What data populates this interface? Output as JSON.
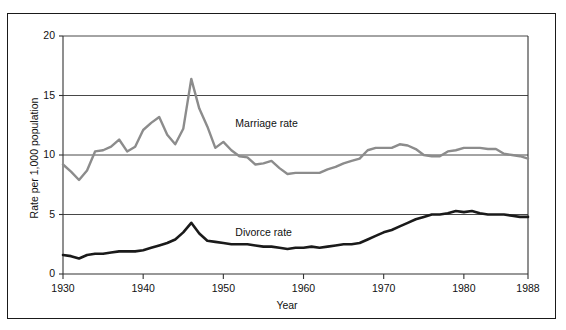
{
  "figure": {
    "background": "#ffffff",
    "frame_color": "#1a1a1a"
  },
  "chart_data": {
    "type": "line",
    "title": "",
    "xlabel": "Year",
    "ylabel": "Rate per 1,000 population",
    "xlim": [
      1930,
      1988
    ],
    "ylim": [
      0,
      20
    ],
    "grid": "horizontal",
    "legend_position": "inline-annotation",
    "x_ticks": [
      1930,
      1940,
      1950,
      1960,
      1970,
      1980,
      1988
    ],
    "x_tick_labels": [
      "1930",
      "1940",
      "1950",
      "1960",
      "1970",
      "1980",
      "1988"
    ],
    "y_ticks": [
      0,
      5,
      10,
      15,
      20
    ],
    "y_tick_labels": [
      "0",
      "5",
      "10",
      "15",
      "20"
    ],
    "annotations": [
      {
        "text": "Marriage rate",
        "x": 1951.5,
        "y": 12.6
      },
      {
        "text": "Divorce rate",
        "x": 1951.5,
        "y": 3.45
      }
    ],
    "series": [
      {
        "name": "Marriage rate",
        "color": "#8c8c8c",
        "width": 2.4,
        "x": [
          1930,
          1931,
          1932,
          1933,
          1934,
          1935,
          1936,
          1937,
          1938,
          1939,
          1940,
          1941,
          1942,
          1943,
          1944,
          1945,
          1946,
          1947,
          1948,
          1949,
          1950,
          1951,
          1952,
          1953,
          1954,
          1955,
          1956,
          1957,
          1958,
          1959,
          1960,
          1961,
          1962,
          1963,
          1964,
          1965,
          1966,
          1967,
          1968,
          1969,
          1970,
          1971,
          1972,
          1973,
          1974,
          1975,
          1976,
          1977,
          1978,
          1979,
          1980,
          1981,
          1982,
          1983,
          1984,
          1985,
          1986,
          1987,
          1988
        ],
        "values": [
          9.2,
          8.6,
          7.9,
          8.7,
          10.3,
          10.4,
          10.7,
          11.3,
          10.3,
          10.7,
          12.1,
          12.7,
          13.2,
          11.7,
          10.9,
          12.2,
          16.4,
          13.9,
          12.4,
          10.6,
          11.1,
          10.4,
          9.9,
          9.8,
          9.2,
          9.3,
          9.5,
          8.9,
          8.4,
          8.5,
          8.5,
          8.5,
          8.5,
          8.8,
          9.0,
          9.3,
          9.5,
          9.7,
          10.4,
          10.6,
          10.6,
          10.6,
          10.9,
          10.8,
          10.5,
          10.0,
          9.9,
          9.9,
          10.3,
          10.4,
          10.6,
          10.6,
          10.6,
          10.5,
          10.5,
          10.1,
          10.0,
          9.9,
          9.7
        ]
      },
      {
        "name": "Divorce rate",
        "color": "#1a1a1a",
        "width": 2.6,
        "x": [
          1930,
          1931,
          1932,
          1933,
          1934,
          1935,
          1936,
          1937,
          1938,
          1939,
          1940,
          1941,
          1942,
          1943,
          1944,
          1945,
          1946,
          1947,
          1948,
          1949,
          1950,
          1951,
          1952,
          1953,
          1954,
          1955,
          1956,
          1957,
          1958,
          1959,
          1960,
          1961,
          1962,
          1963,
          1964,
          1965,
          1966,
          1967,
          1968,
          1969,
          1970,
          1971,
          1972,
          1973,
          1974,
          1975,
          1976,
          1977,
          1978,
          1979,
          1980,
          1981,
          1982,
          1983,
          1984,
          1985,
          1986,
          1987,
          1988
        ],
        "values": [
          1.6,
          1.5,
          1.3,
          1.6,
          1.7,
          1.7,
          1.8,
          1.9,
          1.9,
          1.9,
          2.0,
          2.2,
          2.4,
          2.6,
          2.9,
          3.5,
          4.3,
          3.4,
          2.8,
          2.7,
          2.6,
          2.5,
          2.5,
          2.5,
          2.4,
          2.3,
          2.3,
          2.2,
          2.1,
          2.2,
          2.2,
          2.3,
          2.2,
          2.3,
          2.4,
          2.5,
          2.5,
          2.6,
          2.9,
          3.2,
          3.5,
          3.7,
          4.0,
          4.3,
          4.6,
          4.8,
          5.0,
          5.0,
          5.1,
          5.3,
          5.2,
          5.3,
          5.1,
          5.0,
          5.0,
          5.0,
          4.9,
          4.8,
          4.8
        ]
      }
    ]
  }
}
